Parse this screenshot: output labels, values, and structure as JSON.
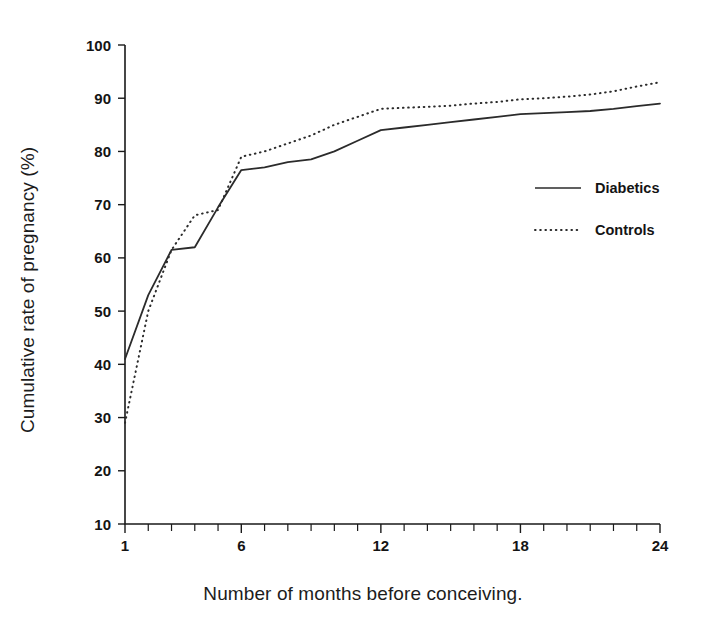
{
  "chart_data": {
    "type": "line",
    "title": "",
    "xlabel": "Number of months before conceiving.",
    "ylabel": "Cumulative rate of pregnancy (%)",
    "xlim": [
      1,
      24
    ],
    "ylim": [
      10,
      100
    ],
    "grid": false,
    "legend_position": "right",
    "x_ticks_major": [
      1,
      6,
      12,
      18,
      24
    ],
    "x_tick_labels": [
      "1",
      "6",
      "12",
      "18",
      "24"
    ],
    "x_ticks_minor": [
      2,
      3,
      4,
      5,
      7,
      8,
      9,
      10,
      11,
      13,
      14,
      15,
      16,
      17,
      19,
      20,
      21,
      22,
      23
    ],
    "y_ticks": [
      10,
      20,
      30,
      40,
      50,
      60,
      70,
      80,
      90,
      100
    ],
    "y_tick_labels": [
      "10",
      "20",
      "30",
      "40",
      "50",
      "60",
      "70",
      "80",
      "90",
      "100"
    ],
    "x": [
      1,
      2,
      3,
      4,
      5,
      6,
      7,
      8,
      9,
      10,
      11,
      12,
      13,
      14,
      15,
      16,
      17,
      18,
      19,
      20,
      21,
      22,
      23,
      24
    ],
    "series": [
      {
        "name": "Diabetics",
        "style": "solid",
        "color": "#2b2b2b",
        "values": [
          41,
          53,
          61.5,
          62,
          69.5,
          76.5,
          77,
          78,
          78.5,
          80,
          82,
          84,
          84.5,
          85,
          85.5,
          86,
          86.5,
          87,
          87.2,
          87.4,
          87.6,
          88,
          88.5,
          89
        ]
      },
      {
        "name": "Controls",
        "style": "dotted",
        "color": "#2b2b2b",
        "values": [
          29,
          50,
          61.5,
          68,
          69,
          79,
          80,
          81.5,
          83,
          85,
          86.5,
          88,
          88.2,
          88.4,
          88.6,
          89,
          89.3,
          89.8,
          90,
          90.3,
          90.7,
          91.3,
          92.2,
          93
        ]
      }
    ]
  },
  "legend": {
    "items": [
      {
        "label": "Diabetics",
        "style": "solid"
      },
      {
        "label": "Controls",
        "style": "dotted"
      }
    ]
  }
}
